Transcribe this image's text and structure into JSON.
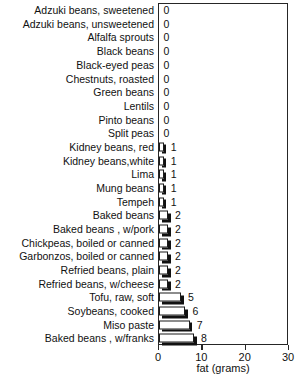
{
  "chart_data": {
    "type": "bar",
    "orientation": "horizontal",
    "title": "",
    "title_note": "title cropped off top edge of screenshot, not legible",
    "xlabel": "fat (grams)",
    "ylabel": "",
    "xlim": [
      0,
      30
    ],
    "xticks": [
      0,
      10,
      20,
      30
    ],
    "xtick_labels": [
      "0",
      "10",
      "20",
      "30"
    ],
    "grid": false,
    "legend": null,
    "categories": [
      "Adzuki beans, sweetened",
      "Adzuki beans, unsweetened",
      "Alfalfa sprouts",
      "Black beans",
      "Black-eyed peas",
      "Chestnuts, roasted",
      "Green beans",
      "Lentils",
      "Pinto beans",
      "Split peas",
      "Kidney beans, red",
      "Kidney beans,white",
      "Lima",
      "Mung beans",
      "Tempeh",
      "Baked beans",
      "Baked beans , w/pork",
      "Chickpeas, boiled or canned",
      "Garbonzos, boiled or canned",
      "Refried beans, plain",
      "Refried beans, w/cheese",
      "Tofu, raw, soft",
      "Soybeans, cooked",
      "Miso paste",
      "Baked beans , w/franks"
    ],
    "values": [
      0,
      0,
      0,
      0,
      0,
      0,
      0,
      0,
      0,
      0,
      1,
      1,
      1,
      1,
      1,
      2,
      2,
      2,
      2,
      2,
      2,
      5,
      6,
      7,
      8
    ],
    "value_labels": [
      "0",
      "0",
      "0",
      "0",
      "0",
      "0",
      "0",
      "0",
      "0",
      "0",
      "1",
      "1",
      "1",
      "1",
      "1",
      "2",
      "2",
      "2",
      "2",
      "2",
      "2",
      "5",
      "6",
      "7",
      "8"
    ]
  },
  "colors": {
    "bar_face": "#ffffff",
    "bar_edge": "#1b1b1b",
    "bar_shadow": "#111111",
    "axis": "#262626",
    "text": "#111111",
    "background": "#ffffff"
  }
}
